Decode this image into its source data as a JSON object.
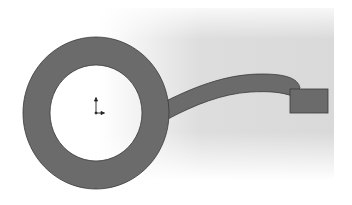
{
  "viewport": {
    "background_color": "#d9d9d9",
    "view": "CAD sketch / model viewport"
  },
  "model": {
    "fill_color": "#6b6b6b",
    "edge_color": "#3a3a3a",
    "ring": {
      "center": [
        96,
        113
      ],
      "outer_radius": 73,
      "inner_radius": 47
    },
    "sweep_path": {
      "shape": "curved band",
      "start": [
        168,
        109
      ],
      "end": [
        298,
        90
      ]
    },
    "profile": {
      "shape": "rectangle",
      "x": 290,
      "y": 89,
      "width": 38,
      "height": 24
    }
  },
  "origin_marker": {
    "icon": "coordinate-origin-icon",
    "position": [
      96,
      113
    ]
  }
}
